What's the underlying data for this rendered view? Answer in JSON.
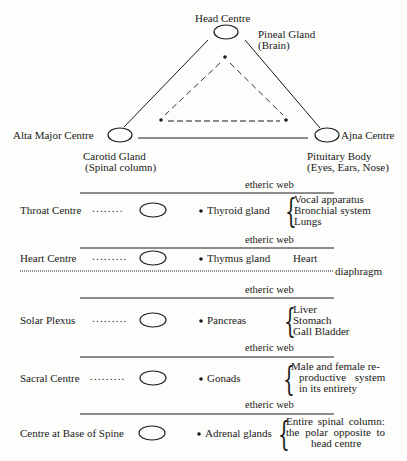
{
  "head_triangle": {
    "head_centre": {
      "label": "Head Centre",
      "gland": "Pineal Gland",
      "region": "(Brain)"
    },
    "alta_major_centre": {
      "label": "Alta Major Centre",
      "gland": "Carotid Gland",
      "region": "(Spinal column)"
    },
    "ajna_centre": {
      "label": "Ajna Centre",
      "gland": "Pituitary Body",
      "region": "(Eyes, Ears, Nose)"
    }
  },
  "separator_label": "etheric web",
  "diaphragm_label": "diaphragm",
  "rows": [
    {
      "centre": "Throat Centre",
      "dots": "........",
      "gland": "Thyroid gland",
      "organs": [
        "Vocal apparatus",
        "Bronchial system",
        "Lungs"
      ]
    },
    {
      "centre": "Heart Centre",
      "dots": ".........",
      "gland": "Thymus gland",
      "organs": [
        "Heart"
      ]
    },
    {
      "centre": "Solar Plexus",
      "dots": ".........",
      "gland": "Pancreas",
      "organs": [
        "Liver",
        "Stomach",
        "Gall Bladder"
      ]
    },
    {
      "centre": "Sacral Centre",
      "dots": ".........",
      "gland": "Gonads",
      "organs": [
        "Male and female re-",
        "productive system",
        "in its entirety"
      ]
    },
    {
      "centre": "Centre at Base of Spine",
      "dots": "",
      "gland": "Adrenal glands",
      "organs": [
        "Entire spinal column:",
        "the polar opposite to",
        "head centre"
      ]
    }
  ],
  "colors": {
    "ink": "#1a1a1a",
    "paper": "#fdfdfb"
  }
}
